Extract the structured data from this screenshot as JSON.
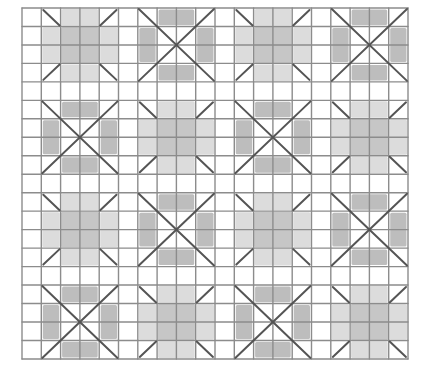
{
  "diagram": {
    "title": "",
    "type": "quilt-grid-pattern",
    "grid": {
      "origin_x": 22,
      "origin_y": 8,
      "columns": 20,
      "rows": 19,
      "cell_width": 19.3,
      "cell_height": 18.47,
      "line_color": "#8c8c8c",
      "line_width": 1.4
    },
    "block_layout": {
      "block_size_cells": 4,
      "column_starts": [
        1,
        6,
        11,
        16
      ],
      "row_starts": [
        0,
        5,
        10,
        15
      ],
      "pattern_rows": [
        [
          "A",
          "B",
          "A",
          "B"
        ],
        [
          "B",
          "A",
          "B",
          "A"
        ],
        [
          "A",
          "B",
          "A",
          "B"
        ],
        [
          "B",
          "A",
          "B",
          "A"
        ]
      ]
    },
    "block_types": {
      "A": {
        "name": "plus-with-corner-stubs",
        "center_color": "#c6c6c6",
        "arm_color": "#dcdcdc",
        "stub_color": "#555555"
      },
      "B": {
        "name": "x-with-edge-bars",
        "bar_color": "#bdbdbd",
        "diagonal_color": "#555555"
      }
    },
    "colors": {
      "background": "#ffffff",
      "border": "#8c8c8c"
    }
  }
}
